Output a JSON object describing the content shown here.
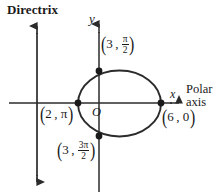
{
  "figure": {
    "type": "polar-conic-diagram",
    "width": 222,
    "height": 193,
    "background": "#ffffff",
    "stroke_color": "#2b2b2b"
  },
  "labels": {
    "directrix": "Directrix",
    "axis_y": "y",
    "axis_x": "x",
    "polar_axis_line1": "Polar",
    "polar_axis_line2": "axis",
    "origin": "O"
  },
  "points": [
    {
      "name": "vertex-left",
      "r": "2",
      "theta_num": "",
      "theta_den": "",
      "theta_simple": "π",
      "label_text": "(2, π)",
      "cx": 78,
      "cy": 103
    },
    {
      "name": "vertex-top",
      "r": "3",
      "theta_num": "π",
      "theta_den": "2",
      "theta_simple": "",
      "label_text": "(3, π/2)",
      "cx": 99,
      "cy": 71
    },
    {
      "name": "vertex-bottom",
      "r": "3",
      "theta_num": "3π",
      "theta_den": "2",
      "theta_simple": "",
      "label_text": "(3, 3π/2)",
      "cx": 99,
      "cy": 136
    },
    {
      "name": "vertex-right",
      "r": "6",
      "theta_num": "",
      "theta_den": "",
      "theta_simple": "0",
      "label_text": "(6, 0)",
      "cx": 161,
      "cy": 103
    }
  ],
  "geometry": {
    "ellipse": {
      "cx": 119.5,
      "cy": 103.5,
      "rx": 41.5,
      "ry": 33.0
    },
    "directrix_line": {
      "x": 37,
      "y_top": 24,
      "y_bottom": 184
    },
    "polar_axis_line": {
      "y": 103,
      "x_left": 9,
      "x_right": 181
    },
    "y_axis_line": {
      "x": 99,
      "y_top": 22,
      "y_bottom": 192
    }
  }
}
